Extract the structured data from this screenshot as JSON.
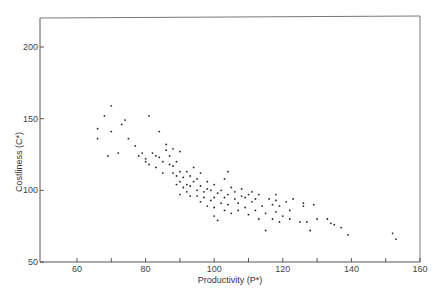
{
  "chart_data": {
    "type": "scatter",
    "title": "",
    "xlabel": "Productivity (P*)",
    "ylabel": "Costliness (C*)",
    "xlim": [
      50,
      160
    ],
    "ylim": [
      50,
      220
    ],
    "xticks": [
      60,
      80,
      100,
      120,
      140,
      160
    ],
    "yticks": [
      50,
      100,
      150,
      200
    ],
    "minor_xticks": [
      70,
      90,
      110,
      130,
      150
    ],
    "grid": false,
    "legend": null,
    "series": [
      {
        "name": "observations",
        "points": [
          [
            66,
            143
          ],
          [
            66,
            136
          ],
          [
            68,
            152
          ],
          [
            69,
            124
          ],
          [
            70,
            141
          ],
          [
            70,
            159
          ],
          [
            72,
            126
          ],
          [
            73,
            146
          ],
          [
            74,
            149
          ],
          [
            75,
            136
          ],
          [
            77,
            131
          ],
          [
            78,
            124
          ],
          [
            79,
            126
          ],
          [
            80,
            120
          ],
          [
            80,
            122
          ],
          [
            81,
            152
          ],
          [
            81,
            118
          ],
          [
            82,
            126
          ],
          [
            83,
            116
          ],
          [
            83,
            124
          ],
          [
            84,
            141
          ],
          [
            84,
            123
          ],
          [
            85,
            112
          ],
          [
            85,
            120
          ],
          [
            86,
            132
          ],
          [
            86,
            128
          ],
          [
            87,
            118
          ],
          [
            87,
            124
          ],
          [
            88,
            112
          ],
          [
            88,
            117
          ],
          [
            88,
            129
          ],
          [
            89,
            104
          ],
          [
            89,
            110
          ],
          [
            89,
            120
          ],
          [
            90,
            97
          ],
          [
            90,
            106
          ],
          [
            90,
            113
          ],
          [
            90,
            127
          ],
          [
            91,
            102
          ],
          [
            91,
            109
          ],
          [
            92,
            99
          ],
          [
            92,
            113
          ],
          [
            92,
            104
          ],
          [
            93,
            96
          ],
          [
            93,
            103
          ],
          [
            93,
            110
          ],
          [
            94,
            106
          ],
          [
            94,
            116
          ],
          [
            95,
            96
          ],
          [
            95,
            100
          ],
          [
            95,
            108
          ],
          [
            96,
            92
          ],
          [
            96,
            103
          ],
          [
            96,
            112
          ],
          [
            97,
            99
          ],
          [
            97,
            95
          ],
          [
            98,
            89
          ],
          [
            98,
            106
          ],
          [
            98,
            101
          ],
          [
            99,
            93
          ],
          [
            99,
            100
          ],
          [
            100,
            82
          ],
          [
            100,
            88
          ],
          [
            100,
            95
          ],
          [
            100,
            104
          ],
          [
            101,
            79
          ],
          [
            101,
            98
          ],
          [
            102,
            91
          ],
          [
            102,
            100
          ],
          [
            103,
            86
          ],
          [
            103,
            95
          ],
          [
            103,
            108
          ],
          [
            104,
            113
          ],
          [
            104,
            97
          ],
          [
            104,
            90
          ],
          [
            105,
            102
          ],
          [
            105,
            84
          ],
          [
            106,
            94
          ],
          [
            106,
            99
          ],
          [
            107,
            91
          ],
          [
            107,
            86
          ],
          [
            108,
            96
          ],
          [
            108,
            101
          ],
          [
            109,
            88
          ],
          [
            109,
            95
          ],
          [
            110,
            83
          ],
          [
            110,
            97
          ],
          [
            111,
            92
          ],
          [
            111,
            99
          ],
          [
            112,
            86
          ],
          [
            112,
            94
          ],
          [
            113,
            80
          ],
          [
            113,
            97
          ],
          [
            114,
            89
          ],
          [
            115,
            72
          ],
          [
            115,
            84
          ],
          [
            116,
            94
          ],
          [
            117,
            80
          ],
          [
            117,
            90
          ],
          [
            118,
            97
          ],
          [
            118,
            93
          ],
          [
            118,
            85
          ],
          [
            119,
            89
          ],
          [
            119,
            78
          ],
          [
            120,
            82
          ],
          [
            121,
            92
          ],
          [
            122,
            86
          ],
          [
            122,
            80
          ],
          [
            123,
            94
          ],
          [
            125,
            78
          ],
          [
            126,
            89
          ],
          [
            126,
            91
          ],
          [
            127,
            78
          ],
          [
            128,
            72
          ],
          [
            129,
            90
          ],
          [
            130,
            80
          ],
          [
            133,
            80
          ],
          [
            134,
            77
          ],
          [
            135,
            76
          ],
          [
            137,
            74
          ],
          [
            139,
            69
          ],
          [
            152,
            70
          ],
          [
            153,
            66
          ]
        ]
      }
    ]
  },
  "axes": {
    "x_title": "Productivity (P*)",
    "y_title": "Costliness (C*)",
    "x_tick_labels": [
      "60",
      "80",
      "100",
      "120",
      "140",
      "160"
    ],
    "y_tick_labels": [
      "50",
      "100",
      "150",
      "200"
    ]
  }
}
